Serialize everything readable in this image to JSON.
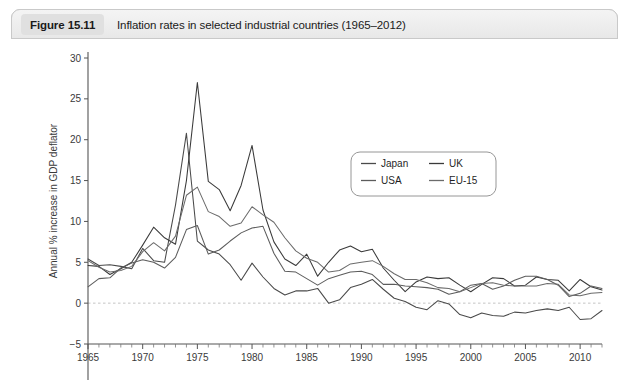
{
  "figure": {
    "badge": "Figure 15.11",
    "caption": "Inflation rates in selected industrial countries (1965–2012)"
  },
  "chart_data": {
    "type": "line",
    "title": "Inflation rates in selected industrial countries (1965–2012)",
    "xlabel": "",
    "ylabel": "Annual % increase in GDP deflator",
    "xlim": [
      1965,
      2012
    ],
    "ylim": [
      -5,
      30
    ],
    "yticks": [
      -5,
      0,
      5,
      10,
      15,
      20,
      25,
      30
    ],
    "ytick_labels": [
      "−5",
      "0",
      "5",
      "10",
      "15",
      "20",
      "25",
      "30"
    ],
    "xticks": [
      1965,
      1970,
      1975,
      1980,
      1985,
      1990,
      1995,
      2000,
      2005,
      2010
    ],
    "xtick_labels": [
      "1965",
      "1970",
      "1975",
      "1980",
      "1985",
      "1990",
      "1995",
      "2000",
      "2005",
      "2010"
    ],
    "x_minor_tick_step": 1,
    "grid": false,
    "zero_reference_line": true,
    "legend_position": "upper-center",
    "x": [
      1965,
      1966,
      1967,
      1968,
      1969,
      1970,
      1971,
      1972,
      1973,
      1974,
      1975,
      1976,
      1977,
      1978,
      1979,
      1980,
      1981,
      1982,
      1983,
      1984,
      1985,
      1986,
      1987,
      1988,
      1989,
      1990,
      1991,
      1992,
      1993,
      1994,
      1995,
      1996,
      1997,
      1998,
      1999,
      2000,
      2001,
      2002,
      2003,
      2004,
      2005,
      2006,
      2007,
      2008,
      2009,
      2010,
      2011,
      2012
    ],
    "series": [
      {
        "name": "Japan",
        "color": "#4a4a4a",
        "values": [
          5.4,
          4.6,
          4.7,
          4.5,
          4.2,
          6.7,
          5.2,
          5.0,
          12.0,
          20.8,
          7.6,
          6.5,
          6.0,
          4.7,
          2.8,
          4.9,
          3.2,
          1.8,
          1.0,
          1.5,
          1.5,
          1.8,
          0.0,
          0.4,
          1.9,
          2.3,
          2.9,
          1.7,
          0.6,
          0.2,
          -0.5,
          -0.8,
          0.3,
          -0.1,
          -1.4,
          -1.8,
          -1.2,
          -1.5,
          -1.6,
          -1.1,
          -1.2,
          -0.9,
          -0.7,
          -0.9,
          -0.5,
          -2.0,
          -1.9,
          -0.9
        ]
      },
      {
        "name": "UK",
        "color": "#3a3a3a",
        "values": [
          4.6,
          4.5,
          3.5,
          4.2,
          5.0,
          7.1,
          9.3,
          8.0,
          7.2,
          15.0,
          27.0,
          14.9,
          13.9,
          11.3,
          14.4,
          19.3,
          11.4,
          7.5,
          5.4,
          4.6,
          6.0,
          3.3,
          5.0,
          6.5,
          7.0,
          6.3,
          6.6,
          4.3,
          2.8,
          1.4,
          2.6,
          3.2,
          3.0,
          3.1,
          2.2,
          1.4,
          2.3,
          3.1,
          3.0,
          2.1,
          2.2,
          3.2,
          2.9,
          2.8,
          1.5,
          2.9,
          2.0,
          1.6
        ]
      },
      {
        "name": "USA",
        "color": "#5c5c5c",
        "values": [
          2.0,
          3.0,
          3.1,
          4.3,
          4.9,
          5.3,
          5.0,
          4.3,
          5.6,
          9.0,
          9.5,
          6.0,
          6.5,
          7.6,
          8.6,
          9.2,
          9.4,
          6.1,
          3.9,
          3.8,
          3.0,
          2.2,
          3.0,
          3.4,
          3.8,
          3.9,
          3.5,
          2.3,
          2.3,
          2.1,
          2.0,
          1.9,
          1.7,
          1.1,
          1.4,
          2.2,
          2.4,
          1.7,
          2.1,
          2.8,
          3.3,
          3.3,
          2.9,
          2.2,
          0.8,
          1.2,
          2.1,
          1.8
        ]
      },
      {
        "name": "EU-15",
        "color": "#6b6b6b",
        "values": [
          5.2,
          4.4,
          3.8,
          4.0,
          4.5,
          6.3,
          7.4,
          6.4,
          8.2,
          13.2,
          14.2,
          11.2,
          10.6,
          9.4,
          9.8,
          11.8,
          10.8,
          9.9,
          8.0,
          6.4,
          5.5,
          5.0,
          3.8,
          4.0,
          4.8,
          5.0,
          5.2,
          4.5,
          3.6,
          2.9,
          2.9,
          2.5,
          1.9,
          1.8,
          1.4,
          1.9,
          2.4,
          2.5,
          2.2,
          2.1,
          2.1,
          2.1,
          2.4,
          2.3,
          1.0,
          0.9,
          1.2,
          1.3
        ]
      }
    ]
  }
}
